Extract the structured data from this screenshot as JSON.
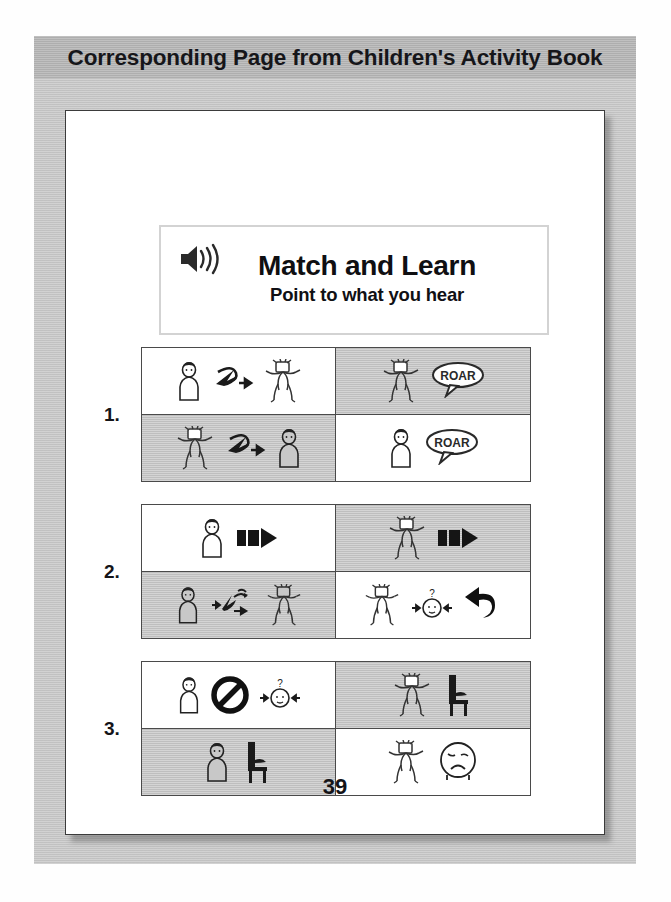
{
  "header": {
    "title": "Corresponding Page from Children's Activity Book",
    "background_color": "#b7b7b7"
  },
  "frame": {
    "color": "#c9c9c9",
    "page_background": "#ffffff"
  },
  "activity_card": {
    "speaker_icon": "speaker-volume-icon",
    "title": "Match and Learn",
    "subtitle": "Point to what you hear"
  },
  "colors": {
    "cell_gray": "#c8c8c8",
    "cell_white": "#ffffff",
    "grid_line": "#4a4a4a",
    "text": "#141418"
  },
  "exercises": [
    {
      "number": "1.",
      "cells": [
        {
          "position": "top-left",
          "shade": "white",
          "symbols": [
            "child-standing-icon",
            "looks-at-arrow-icon",
            "lion-icon"
          ]
        },
        {
          "position": "top-right",
          "shade": "gray",
          "symbols": [
            "lion-icon",
            "roar-speech-bubble-icon"
          ],
          "speech_text": "ROAR"
        },
        {
          "position": "bottom-left",
          "shade": "gray",
          "symbols": [
            "lion-icon",
            "looks-at-arrow-icon",
            "child-standing-icon"
          ]
        },
        {
          "position": "bottom-right",
          "shade": "white",
          "symbols": [
            "child-standing-icon",
            "roar-speech-bubble-icon"
          ],
          "speech_text": "ROAR"
        }
      ]
    },
    {
      "number": "2.",
      "cells": [
        {
          "position": "top-left",
          "shade": "white",
          "symbols": [
            "child-standing-icon",
            "forward-block-arrow-icon"
          ]
        },
        {
          "position": "top-right",
          "shade": "gray",
          "symbols": [
            "lion-icon",
            "forward-block-arrow-icon"
          ]
        },
        {
          "position": "bottom-left",
          "shade": "gray",
          "symbols": [
            "child-standing-icon",
            "interaction-arrows-icon",
            "lion-icon"
          ]
        },
        {
          "position": "bottom-right",
          "shade": "white",
          "symbols": [
            "lion-icon",
            "question-face-icon",
            "return-back-arrow-icon"
          ]
        }
      ]
    },
    {
      "number": "3.",
      "cells": [
        {
          "position": "top-left",
          "shade": "white",
          "symbols": [
            "child-standing-icon",
            "prohibited-sign-icon",
            "question-face-icon"
          ]
        },
        {
          "position": "top-right",
          "shade": "gray",
          "symbols": [
            "lion-icon",
            "chair-icon"
          ]
        },
        {
          "position": "bottom-left",
          "shade": "gray",
          "symbols": [
            "child-standing-icon",
            "chair-icon"
          ]
        },
        {
          "position": "bottom-right",
          "shade": "white",
          "symbols": [
            "lion-icon",
            "sad-face-icon"
          ]
        }
      ]
    }
  ],
  "page_number": "39"
}
